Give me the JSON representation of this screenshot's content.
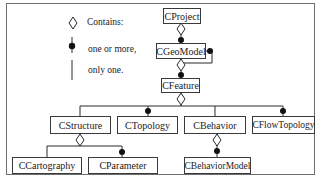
{
  "legend": {
    "items": [
      {
        "symbol": "diamond-icon",
        "label": "Contains:"
      },
      {
        "symbol": "filled-circle-line-icon",
        "label": "one or more,"
      },
      {
        "symbol": "line-icon",
        "label": "only one."
      }
    ]
  },
  "nodes": {
    "cproject": "CProject",
    "cgeomodel": "CGeoModel",
    "cfeature": "CFeature",
    "cstructure": "CStructure",
    "ctopology": "CTopology",
    "cbehavior": "CBehavior",
    "cflowtopology": "CFlowTopology",
    "ccartography": "CCartography",
    "cparameter": "CParameter",
    "cbehaviormodel": "CBehaviorModel"
  },
  "relations": [
    {
      "from": "CProject",
      "to": "CGeoModel",
      "type": "contains",
      "multiplicity": "one or more"
    },
    {
      "from": "CGeoModel",
      "to": "CGeoModel",
      "type": "self",
      "multiplicity": "one or more"
    },
    {
      "from": "CGeoModel",
      "to": "CFeature",
      "type": "contains",
      "multiplicity": "one or more"
    },
    {
      "from": "CFeature",
      "to": "CStructure",
      "type": "contains",
      "multiplicity": "only one"
    },
    {
      "from": "CFeature",
      "to": "CTopology",
      "type": "contains",
      "multiplicity": "one or more"
    },
    {
      "from": "CFeature",
      "to": "CBehavior",
      "type": "contains",
      "multiplicity": "only one"
    },
    {
      "from": "CFeature",
      "to": "CFlowTopology",
      "type": "contains",
      "multiplicity": "one or more"
    },
    {
      "from": "CStructure",
      "to": "CCartography",
      "type": "contains",
      "multiplicity": "only one"
    },
    {
      "from": "CStructure",
      "to": "CParameter",
      "type": "contains",
      "multiplicity": "one or more"
    },
    {
      "from": "CBehavior",
      "to": "CBehaviorModel",
      "type": "contains",
      "multiplicity": "one or more"
    }
  ],
  "colors": {
    "line": "#3a3a3a",
    "frame": "#6e6e6e"
  }
}
